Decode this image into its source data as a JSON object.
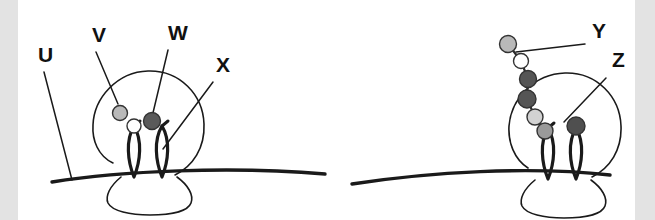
{
  "figure": {
    "background_color": "#ffffff",
    "edge_band_color": "#e3e3e3",
    "stroke_color": "#1a1a1a"
  },
  "labels": [
    {
      "id": "U",
      "text": "U",
      "x": 38,
      "y": 62,
      "panel": "left",
      "points_to": "plasma-membrane"
    },
    {
      "id": "V",
      "text": "V",
      "x": 92,
      "y": 42,
      "panel": "left",
      "points_to": "presynaptic-terminal"
    },
    {
      "id": "W",
      "text": "W",
      "x": 168,
      "y": 40,
      "panel": "left",
      "points_to": "dark-vesicle"
    },
    {
      "id": "X",
      "text": "X",
      "x": 216,
      "y": 72,
      "panel": "left",
      "points_to": "receptor-loop"
    },
    {
      "id": "Y",
      "text": "Y",
      "x": 592,
      "y": 38,
      "panel": "right",
      "points_to": "vesicle-chain"
    },
    {
      "id": "Z",
      "text": "Z",
      "x": 612,
      "y": 67,
      "panel": "right",
      "points_to": "dark-vesicle-right"
    }
  ],
  "leader_lines": [
    {
      "name": "leader-u",
      "x1": 44,
      "y1": 72,
      "x2": 72,
      "y2": 180
    },
    {
      "name": "leader-v",
      "x1": 96,
      "y1": 52,
      "x2": 118,
      "y2": 104
    },
    {
      "name": "leader-w",
      "x1": 168,
      "y1": 50,
      "x2": 152,
      "y2": 117
    },
    {
      "name": "leader-x",
      "x1": 213,
      "y1": 82,
      "x2": 163,
      "y2": 149
    },
    {
      "name": "leader-y",
      "x1": 585,
      "y1": 44,
      "x2": 516,
      "y2": 52
    },
    {
      "name": "leader-z",
      "x1": 606,
      "y1": 78,
      "x2": 564,
      "y2": 122
    }
  ],
  "panels": [
    {
      "name": "left-synapse-panel",
      "membrane": {
        "name": "plasma-membrane-left",
        "path": "M 52,182 C 120,171 230,166 325,174"
      },
      "bouton": {
        "name": "presynaptic-terminal-left",
        "path": "M 113,163 C 98,156 92,140 93,125 C 94,98 117,72 148,71 C 180,70 203,95 204,124 C 205,148 193,166 175,175"
      },
      "spine": {
        "name": "postsynaptic-spine-left",
        "path": "M 121,177 C 110,186 105,196 108,203 C 112,211 130,215 150,215 C 172,215 188,211 191,203 C 194,195 188,185 177,177"
      },
      "receptor_loops": [
        {
          "name": "receptor-loop-left-1",
          "x": 134,
          "top": 126,
          "bottom": 177,
          "width": 13
        },
        {
          "name": "receptor-loop-left-2",
          "x": 162,
          "top": 126,
          "bottom": 177,
          "width": 13
        }
      ],
      "vesicles": [
        {
          "name": "vesicle-light-left",
          "cx": 120,
          "cy": 113,
          "r": 7.5,
          "fill": "#b9b9b9",
          "shade": "light-gray"
        },
        {
          "name": "vesicle-white-left",
          "cx": 134,
          "cy": 126,
          "r": 7.0,
          "fill": "#ffffff",
          "shade": "white"
        },
        {
          "name": "vesicle-dark-left",
          "cx": 152,
          "cy": 121,
          "r": 8.5,
          "fill": "#5a5a5a",
          "shade": "dark-gray"
        }
      ]
    },
    {
      "name": "right-synapse-panel",
      "membrane": {
        "name": "plasma-membrane-right",
        "path": "M 352,184 C 430,172 530,166 610,175"
      },
      "bouton": {
        "name": "presynaptic-terminal-right",
        "path": "M 528,168 C 514,159 508,142 509,126 C 511,99 534,74 565,73 C 597,72 620,97 621,126 C 622,150 610,168 592,177"
      },
      "spine": {
        "name": "postsynaptic-spine-right",
        "path": "M 535,180 C 524,189 519,199 522,206 C 526,214 544,218 564,218 C 586,218 602,214 605,206 C 608,198 602,188 591,180"
      },
      "receptor_loops": [
        {
          "name": "receptor-loop-right-1",
          "x": 548,
          "top": 128,
          "bottom": 179,
          "width": 13
        },
        {
          "name": "receptor-loop-right-2",
          "x": 576,
          "top": 128,
          "bottom": 179,
          "width": 13
        }
      ],
      "vesicles": [
        {
          "name": "vesicle-chain-1",
          "cx": 508,
          "cy": 44,
          "r": 8.5,
          "fill": "#b9b9b9",
          "shade": "light-gray"
        },
        {
          "name": "vesicle-chain-2",
          "cx": 521,
          "cy": 61,
          "r": 7.5,
          "fill": "#ffffff",
          "shade": "white"
        },
        {
          "name": "vesicle-chain-3",
          "cx": 528,
          "cy": 79,
          "r": 8.5,
          "fill": "#555555",
          "shade": "dark-gray"
        },
        {
          "name": "vesicle-chain-4",
          "cx": 527,
          "cy": 99,
          "r": 9.0,
          "fill": "#555555",
          "shade": "dark-gray"
        },
        {
          "name": "vesicle-chain-5",
          "cx": 535,
          "cy": 117,
          "r": 8.0,
          "fill": "#d2d2d2",
          "shade": "light-gray"
        },
        {
          "name": "vesicle-chain-6",
          "cx": 545,
          "cy": 131,
          "r": 8.0,
          "fill": "#9a9a9a",
          "shade": "medium-gray"
        },
        {
          "name": "vesicle-dark-right",
          "cx": 576,
          "cy": 126,
          "r": 9.0,
          "fill": "#4f4f4f",
          "shade": "dark-gray"
        }
      ],
      "chain_path": "M 508,44 L 521,61 L 528,79 L 527,99 L 535,117 L 545,131"
    }
  ]
}
